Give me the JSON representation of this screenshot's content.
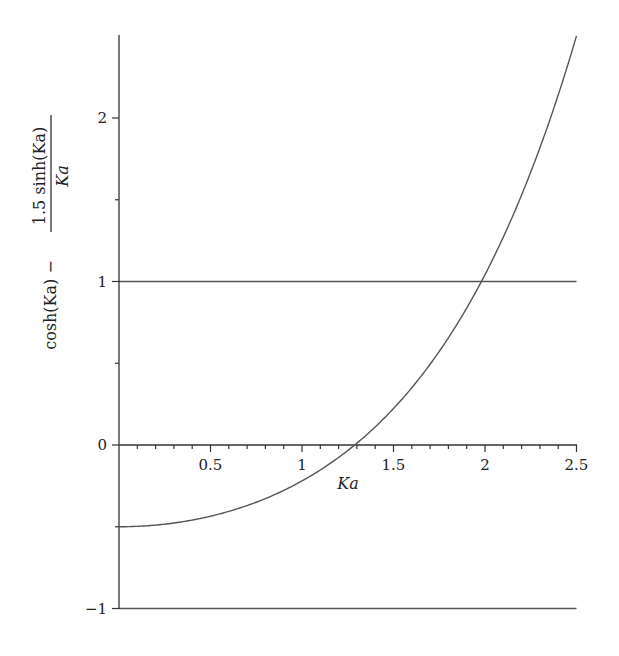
{
  "chart_data": {
    "type": "line",
    "title": "",
    "xlabel": "Ka",
    "ylabel": {
      "prefix": "cosh(Ka) −",
      "numerator": "1.5 sinh(Ka)",
      "denominator": "Ka",
      "full": "cosh(Ka) − 1.5 sinh(Ka)/Ka"
    },
    "xlim": [
      0,
      2.5
    ],
    "ylim": [
      -1,
      2.5
    ],
    "grid": false,
    "legend": null,
    "x_ticks": [
      {
        "value": 0.5,
        "label": "0.5"
      },
      {
        "value": 1,
        "label": "1"
      },
      {
        "value": 1.5,
        "label": "1.5"
      },
      {
        "value": 2,
        "label": "2"
      },
      {
        "value": 2.5,
        "label": "2.5"
      }
    ],
    "y_ticks": [
      {
        "value": -1,
        "label": "−1"
      },
      {
        "value": 0,
        "label": "0"
      },
      {
        "value": 1,
        "label": "1"
      },
      {
        "value": 2,
        "label": "2"
      }
    ],
    "series": [
      {
        "name": "cosh(Ka) − 1.5 sinh(Ka)/Ka",
        "x": [
          0,
          0.25,
          0.5,
          0.75,
          1.0,
          1.25,
          1.5,
          1.75,
          2.0,
          2.25,
          2.5
        ],
        "y": [
          -0.5,
          -0.484,
          -0.436,
          -0.35,
          -0.22,
          -0.034,
          0.223,
          0.572,
          1.042,
          1.669,
          2.502
        ]
      }
    ],
    "reference_lines": [
      {
        "y": 1,
        "label": "upper bound"
      },
      {
        "y": -1,
        "label": "lower bound"
      }
    ],
    "annotations": [
      {
        "note": "curve crosses y=0 near Ka≈1.30 and y=1 near Ka≈1.98"
      }
    ]
  }
}
